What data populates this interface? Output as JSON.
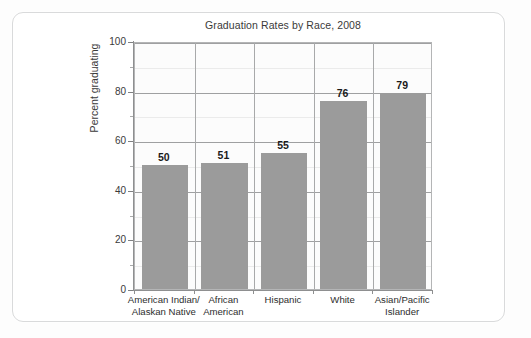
{
  "card": {
    "border_color": "#d9dadb",
    "background": "#ffffff"
  },
  "chart_data": {
    "type": "bar",
    "title": "Graduation Rates by Race, 2008",
    "xlabel": "",
    "ylabel": "Percent graduating",
    "categories": [
      "American Indian/ Alaskan Native",
      "African American",
      "Hispanic",
      "White",
      "Asian/Pacific Islander"
    ],
    "category_lines": [
      [
        "American Indian/",
        "Alaskan Native"
      ],
      [
        "African",
        "American"
      ],
      [
        "Hispanic",
        ""
      ],
      [
        "White",
        ""
      ],
      [
        "Asian/Pacific",
        "Islander"
      ]
    ],
    "values": [
      50,
      51,
      55,
      76,
      79
    ],
    "value_labels": [
      "50",
      "51",
      "55",
      "76",
      "79"
    ],
    "ylim": [
      0,
      100
    ],
    "ytick_labels": [
      "0",
      "20",
      "40",
      "60",
      "80",
      "100"
    ],
    "ytick_values": [
      0,
      20,
      40,
      60,
      80,
      100
    ],
    "yminor_values": [
      10,
      30,
      50,
      70,
      90
    ],
    "grid": "horizontal-and-category-separators",
    "legend": "none",
    "bar_color": "#9b9b9b",
    "gridline_color": "#9fa0a1",
    "axis_color": "#8e8f90",
    "plot_background": "#fcfcfc"
  }
}
